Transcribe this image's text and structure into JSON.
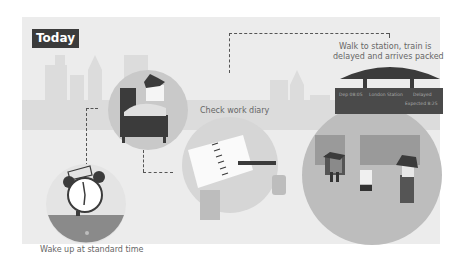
{
  "heading": "Today",
  "steps": [
    {
      "label": "Wake up at standard time",
      "icon": "alarm-clock-icon"
    },
    {
      "label": "Check work diary",
      "icon": "diary-icon"
    },
    {
      "label_line1": "Walk to station, train is",
      "label_line2": "delayed and arrives packed",
      "icon": "train-station-icon"
    }
  ],
  "departure_board": {
    "time": "Dep 08:05",
    "destination": "London Station",
    "status": "Delayed",
    "expected": "Expected 8:25"
  },
  "colors": {
    "panel": "#ececec",
    "dark": "#3b3b3b",
    "mid": "#bdbdbd"
  }
}
